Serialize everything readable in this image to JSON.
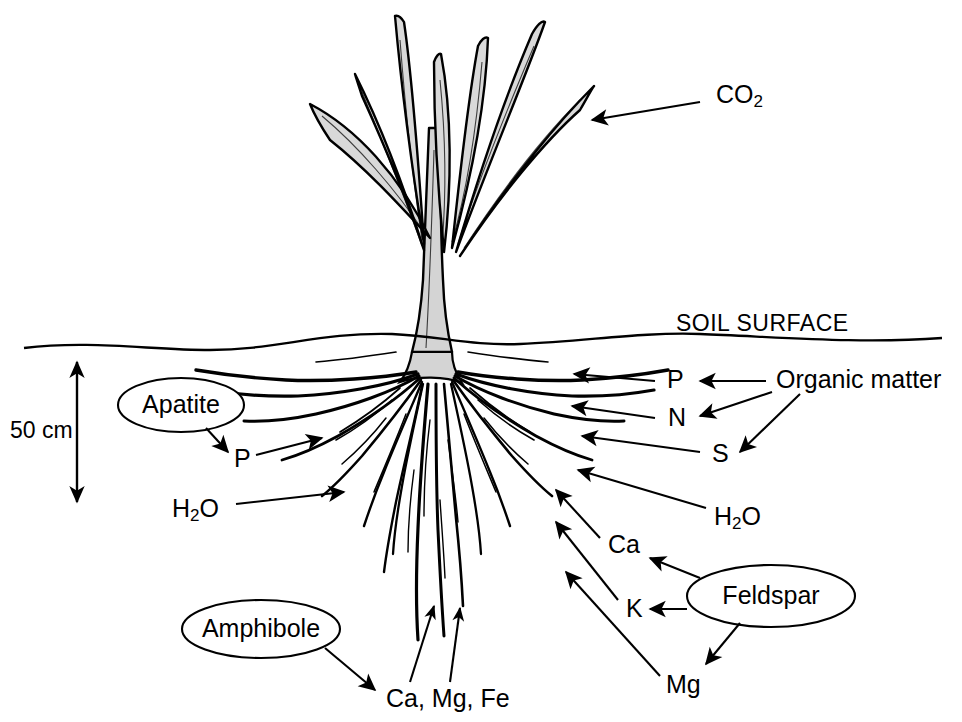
{
  "figure": {
    "background_color": "#ffffff",
    "ink_color": "#000000",
    "leaf_fill_color": "#d9d9d9"
  },
  "soil": {
    "surface_label": "SOIL SURFACE"
  },
  "scale": {
    "depth_label": "50 cm"
  },
  "minerals": [
    {
      "id": "apatite",
      "label": "Apatite"
    },
    {
      "id": "amphibole",
      "label": "Amphibole"
    },
    {
      "id": "feldspar",
      "label": "Feldspar"
    }
  ],
  "sources": [
    {
      "id": "organic-matter",
      "label": "Organic matter"
    }
  ],
  "nutrients": {
    "co2": {
      "label": "CO",
      "subscript": "2"
    },
    "p_left": {
      "label": "P"
    },
    "water_left": {
      "label": "H",
      "subscript": "2",
      "label_tail": "O"
    },
    "p_right": {
      "label": "P"
    },
    "n_right": {
      "label": "N"
    },
    "s_right": {
      "label": "S"
    },
    "water_right": {
      "label": "H",
      "subscript": "2",
      "label_tail": "O"
    },
    "ca_right": {
      "label": "Ca"
    },
    "k_right": {
      "label": "K"
    },
    "mg_right": {
      "label": "Mg"
    },
    "ca_mg_fe": {
      "label": "Ca, Mg, Fe"
    }
  },
  "flows": [
    {
      "from": "atmosphere",
      "to": "leaf",
      "label": "CO2"
    },
    {
      "from": "apatite",
      "to": "P",
      "label": "P"
    },
    {
      "from": "P",
      "to": "root",
      "label": "P"
    },
    {
      "from": "soil-water",
      "to": "root",
      "label": "H2O"
    },
    {
      "from": "organic-matter",
      "to": "P",
      "label": "P"
    },
    {
      "from": "organic-matter",
      "to": "N",
      "label": "N"
    },
    {
      "from": "organic-matter",
      "to": "S",
      "label": "S"
    },
    {
      "from": "P",
      "to": "root-right",
      "label": "P"
    },
    {
      "from": "N",
      "to": "root-right",
      "label": "N"
    },
    {
      "from": "S",
      "to": "root-right",
      "label": "S"
    },
    {
      "from": "H2O",
      "to": "root-right",
      "label": "H2O"
    },
    {
      "from": "feldspar",
      "to": "Ca",
      "label": "Ca"
    },
    {
      "from": "feldspar",
      "to": "K",
      "label": "K"
    },
    {
      "from": "feldspar",
      "to": "Mg",
      "label": "Mg"
    },
    {
      "from": "Ca",
      "to": "root-right",
      "label": "Ca"
    },
    {
      "from": "K",
      "to": "root-right",
      "label": "K"
    },
    {
      "from": "Mg",
      "to": "root-right",
      "label": "Mg"
    },
    {
      "from": "amphibole",
      "to": "Ca, Mg, Fe",
      "label": "Ca, Mg, Fe"
    },
    {
      "from": "Ca, Mg, Fe",
      "to": "deep-root",
      "label": "Ca, Mg, Fe"
    }
  ]
}
